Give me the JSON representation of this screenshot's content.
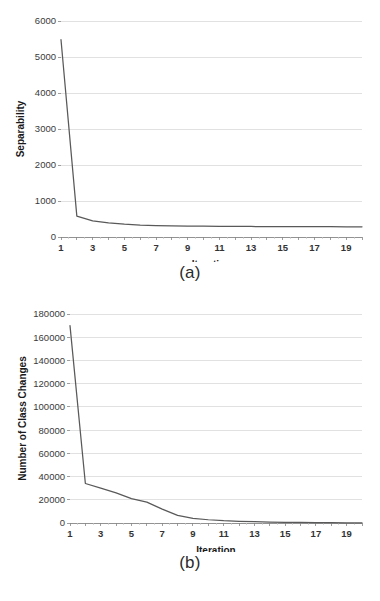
{
  "figure": {
    "panels": [
      {
        "caption": "(a)",
        "chart_index": 0
      },
      {
        "caption": "(b)",
        "chart_index": 1
      }
    ]
  },
  "style": {
    "line_color": "#595959",
    "grid_color": "#d9d9d9",
    "axis_color": "#868686",
    "text_color": "#231f20",
    "background": "#ffffff"
  },
  "chart_data": [
    {
      "type": "line",
      "title": "",
      "xlabel": "Iteration",
      "ylabel": "Separability",
      "xlim": [
        1,
        20
      ],
      "ylim": [
        0,
        6000
      ],
      "grid": true,
      "legend": "none",
      "y_ticks": [
        0,
        1000,
        2000,
        3000,
        4000,
        5000,
        6000
      ],
      "y_tick_labels": [
        "0",
        "1000",
        "2000",
        "3000",
        "4000",
        "5000",
        "6000"
      ],
      "x_ticks": [
        1,
        2,
        3,
        4,
        5,
        6,
        7,
        8,
        9,
        10,
        11,
        12,
        13,
        14,
        15,
        16,
        17,
        18,
        19,
        20
      ],
      "x_tick_labels": [
        "1",
        "",
        "3",
        "",
        "5",
        "",
        "7",
        "",
        "9",
        "",
        "11",
        "",
        "13",
        "",
        "15",
        "",
        "17",
        "",
        "19",
        ""
      ],
      "x": [
        1,
        2,
        3,
        4,
        5,
        6,
        7,
        8,
        9,
        10,
        11,
        12,
        13,
        14,
        15,
        16,
        17,
        18,
        19,
        20
      ],
      "values": [
        5480,
        580,
        450,
        390,
        355,
        330,
        318,
        310,
        305,
        300,
        297,
        294,
        292,
        290,
        288,
        287,
        286,
        285,
        284,
        283
      ]
    },
    {
      "type": "line",
      "title": "",
      "xlabel": "Iteration",
      "ylabel": "Number of Class Changes",
      "xlim": [
        1,
        20
      ],
      "ylim": [
        0,
        180000
      ],
      "grid": true,
      "legend": "none",
      "y_ticks": [
        0,
        20000,
        40000,
        60000,
        80000,
        100000,
        120000,
        140000,
        160000,
        180000
      ],
      "y_tick_labels": [
        "0",
        "20000",
        "40000",
        "60000",
        "80000",
        "100000",
        "120000",
        "140000",
        "160000",
        "180000"
      ],
      "x_ticks": [
        1,
        2,
        3,
        4,
        5,
        6,
        7,
        8,
        9,
        10,
        11,
        12,
        13,
        14,
        15,
        16,
        17,
        18,
        19,
        20
      ],
      "x_tick_labels": [
        "1",
        "",
        "3",
        "",
        "5",
        "",
        "7",
        "",
        "9",
        "",
        "11",
        "",
        "13",
        "",
        "15",
        "",
        "17",
        "",
        "19",
        ""
      ],
      "x": [
        1,
        2,
        3,
        4,
        5,
        6,
        7,
        8,
        9,
        10,
        11,
        12,
        13,
        14,
        15,
        16,
        17,
        18,
        19,
        20
      ],
      "values": [
        170000,
        34000,
        30000,
        26000,
        21000,
        18000,
        12000,
        6500,
        4000,
        2800,
        2000,
        1500,
        1100,
        800,
        600,
        450,
        350,
        250,
        180,
        120
      ]
    }
  ]
}
